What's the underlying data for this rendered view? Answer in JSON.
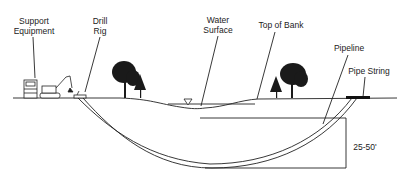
{
  "diagram": {
    "labels": {
      "support_equipment": [
        "Support",
        "Equipment"
      ],
      "drill_rig": [
        "Drill",
        "Rig"
      ],
      "water_surface": [
        "Water",
        "Surface"
      ],
      "top_of_bank": "Top of Bank",
      "pipeline": "Pipeline",
      "pipe_string": "Pipe String",
      "depth": "25-50'"
    },
    "icons": [
      "truck-icon",
      "excavator-icon",
      "drill-rig-icon",
      "tree-icon",
      "water-level-triangle-icon",
      "pipe-string-icon"
    ],
    "colors": {
      "line": "#222222",
      "background": "#ffffff"
    }
  }
}
